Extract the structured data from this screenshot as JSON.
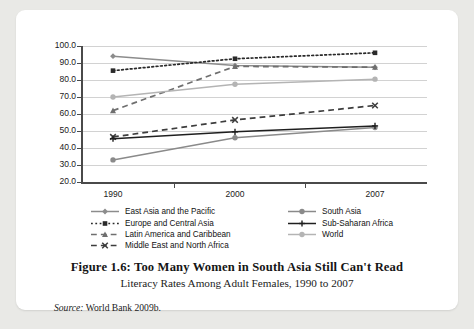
{
  "figure": {
    "title": "Figure 1.6: Too Many Women in South Asia Still Can't Read",
    "subtitle": "Literacy Rates Among Adult Females, 1990 to 2007",
    "source_label": "Source:",
    "source_text": "World Bank 2009b."
  },
  "chart_data": {
    "type": "line",
    "title": "",
    "xlabel": "",
    "ylabel": "",
    "x": [
      1990,
      2000,
      2007
    ],
    "xtick_labels": [
      "1990",
      "2000",
      "2007"
    ],
    "ylim": [
      20.0,
      100.0
    ],
    "ytick_labels": [
      "100.0",
      "90.0",
      "80.0",
      "70.0",
      "60.0",
      "50.0",
      "40.0",
      "30.0",
      "20.0"
    ],
    "yticks": [
      100.0,
      90.0,
      80.0,
      70.0,
      60.0,
      50.0,
      40.0,
      30.0,
      20.0
    ],
    "grid": true,
    "legend_position": "bottom",
    "series": [
      {
        "name": "East Asia and the Pacific",
        "values": [
          94.0,
          88.5,
          87.5
        ],
        "color": "#8c8c8c",
        "style": "solid",
        "marker": "diamond"
      },
      {
        "name": "Europe and Central Asia",
        "values": [
          85.5,
          92.5,
          96.0
        ],
        "color": "#2a2a2a",
        "style": "dotted",
        "marker": "square"
      },
      {
        "name": "Latin America and Caribbean",
        "values": [
          62.0,
          88.0,
          87.5
        ],
        "color": "#6f6f6f",
        "style": "dashed",
        "marker": "triangle"
      },
      {
        "name": "Middle East and North Africa",
        "values": [
          46.5,
          56.5,
          65.0
        ],
        "color": "#3d3d3d",
        "style": "dashed",
        "marker": "cross"
      },
      {
        "name": "South Asia",
        "values": [
          33.0,
          46.0,
          52.0
        ],
        "color": "#8a8a8a",
        "style": "solid",
        "marker": "circle"
      },
      {
        "name": "Sub-Saharan Africa",
        "values": [
          45.5,
          49.5,
          53.0
        ],
        "color": "#1f1f1f",
        "style": "solid",
        "marker": "plus"
      },
      {
        "name": "World",
        "values": [
          70.0,
          77.5,
          80.5
        ],
        "color": "#b4b4b4",
        "style": "solid",
        "marker": "circle"
      }
    ]
  },
  "legend": {
    "columns": [
      [
        "East Asia and the Pacific",
        "Europe and Central Asia",
        "Latin America and Caribbean",
        "Middle East and North Africa"
      ],
      [
        "South Asia",
        "Sub-Saharan Africa",
        "World"
      ]
    ]
  }
}
